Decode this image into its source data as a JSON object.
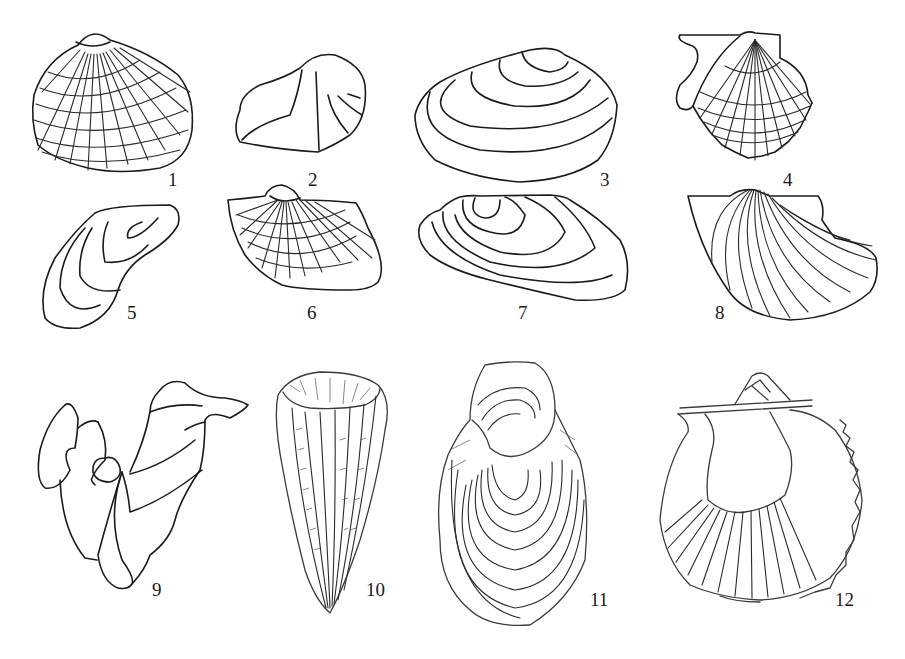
{
  "plate": {
    "description": "Plate of bivalve shell outline drawings",
    "line_color": "#1a1a1a",
    "background_color": "#ffffff",
    "figures": [
      {
        "number": "1",
        "label": "1",
        "shape": "radially ribbed and concentric-lined rounded shell"
      },
      {
        "number": "2",
        "label": "2",
        "shape": "angular shell with diagonal carina"
      },
      {
        "number": "3",
        "label": "3",
        "shape": "elongate oval shell with concentric growth lines"
      },
      {
        "number": "4",
        "label": "4",
        "shape": "scallop-like shell with ears and ribs"
      },
      {
        "number": "5",
        "label": "5",
        "shape": "mytiliform shell with growth lines"
      },
      {
        "number": "6",
        "label": "6",
        "shape": "radially ribbed shell with concentric lines"
      },
      {
        "number": "7",
        "label": "7",
        "shape": "elongate shell with nested growth lines"
      },
      {
        "number": "8",
        "label": "8",
        "shape": "shell with curved radial ribs and ear"
      },
      {
        "number": "9",
        "label": "9",
        "shape": "irregular rudist-like shell"
      },
      {
        "number": "10",
        "label": "10",
        "shape": "conical ribbed rudist shell"
      },
      {
        "number": "11",
        "label": "11",
        "shape": "oyster-like shell with concentric lamellae"
      },
      {
        "number": "12",
        "label": "12",
        "shape": "interior view of pectinid valve with hinge line"
      }
    ]
  }
}
